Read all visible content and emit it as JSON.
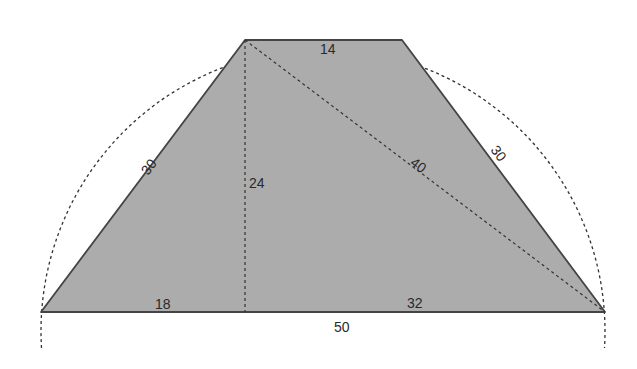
{
  "diagram": {
    "colors": {
      "fill": "#acacac",
      "edge": "#444444",
      "dashed": "#333333",
      "background": "#ffffff"
    },
    "labels": {
      "top_base": "14",
      "left_leg": "30",
      "right_leg": "30",
      "height": "24",
      "diagonal": "40",
      "bottom_left_segment": "18",
      "bottom_right_segment": "32",
      "bottom_base": "50"
    }
  }
}
